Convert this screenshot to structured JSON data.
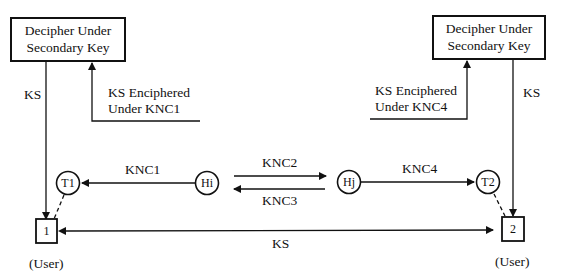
{
  "diagram": {
    "left_box": {
      "line1": "Decipher Under",
      "line2": "Secondary Key"
    },
    "right_box": {
      "line1": "Decipher Under",
      "line2": "Secondary Key"
    },
    "left_ks_label": "KS",
    "right_ks_label": "KS",
    "left_enciphered": {
      "line1": "KS Enciphered",
      "line2": "Under KNC1"
    },
    "right_enciphered": {
      "line1": "KS Enciphered",
      "line2": "Under KNC4"
    },
    "nodes": {
      "t1": "T1",
      "hi": "Hi",
      "hj": "Hj",
      "t2": "T2"
    },
    "edges": {
      "hi_to_t1": "KNC1",
      "hi_to_hj": "KNC2",
      "hj_to_hi": "KNC3",
      "hj_to_t2": "KNC4",
      "user_to_user": "KS"
    },
    "users": {
      "user1_id": "1",
      "user2_id": "2",
      "user1_label": "(User)",
      "user2_label": "(User)"
    }
  }
}
